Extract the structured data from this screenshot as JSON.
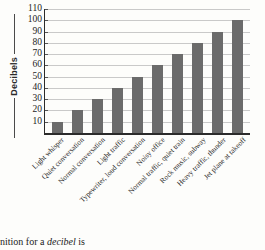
{
  "chart_data": {
    "type": "bar",
    "title": "",
    "xlabel": "",
    "ylabel": "Decibels",
    "ylim": [
      0,
      110
    ],
    "ytick_step": 10,
    "grid": true,
    "legend": null,
    "bar_color": "#6b6b6b",
    "categories": [
      "Light whisper",
      "Quiet conversation",
      "Normal conversation",
      "Light traffic",
      "Typewriter, loud conversation",
      "Noisy office",
      "Normal traffic, quiet train",
      "Rock music, subway",
      "Heavy traffic, thunder",
      "Jet plane at takeoff"
    ],
    "values": [
      10,
      20,
      30,
      40,
      50,
      60,
      70,
      80,
      90,
      100
    ],
    "yticks": [
      10,
      20,
      30,
      40,
      50,
      60,
      70,
      80,
      90,
      100,
      110
    ]
  },
  "caption": {
    "prefix": "nition for a ",
    "italic": "decibel",
    "suffix": " is"
  }
}
